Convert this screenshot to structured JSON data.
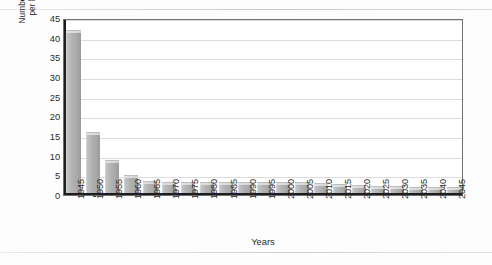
{
  "chart_data": {
    "type": "bar",
    "title": "",
    "xlabel": "Years",
    "ylabel": "Number of workers per beneficiary",
    "ylabel_lines": [
      "Number of workers",
      "per beneficiary"
    ],
    "ylim": [
      0,
      45
    ],
    "yticks": [
      0,
      5,
      10,
      15,
      20,
      25,
      30,
      35,
      40,
      45
    ],
    "grid": true,
    "legend": false,
    "categories": [
      "1945",
      "1950",
      "1955",
      "1960",
      "1965",
      "1970",
      "1975",
      "1980",
      "1985",
      "1990",
      "1995",
      "2000",
      "2005",
      "2010",
      "2015",
      "2020",
      "2025",
      "2030",
      "2035",
      "2040",
      "2045"
    ],
    "values": [
      42,
      16,
      9,
      5,
      3.5,
      3.4,
      3.4,
      3.3,
      3.3,
      3.4,
      3.4,
      3.4,
      3.3,
      3.0,
      2.8,
      2.6,
      2.4,
      2.2,
      2.1,
      2.1,
      2.0
    ],
    "bar_color": "#b2b2b2",
    "bar_top_color": "#dcdcdc",
    "axis_color": "#1d1d1d",
    "gridline_color": "#dcdcdc"
  }
}
